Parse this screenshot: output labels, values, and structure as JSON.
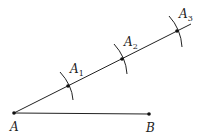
{
  "diagram": {
    "stroke_color": "#222222",
    "points": {
      "A": {
        "label": "A",
        "x": 14,
        "y": 113
      },
      "B": {
        "label": "B",
        "x": 149,
        "y": 114
      },
      "A1": {
        "label": "A",
        "sub": "1",
        "x": 68,
        "y": 86
      },
      "A2": {
        "label": "A",
        "sub": "2",
        "x": 122,
        "y": 59
      },
      "A3": {
        "label": "A",
        "sub": "3",
        "x": 177,
        "y": 31
      }
    },
    "labels": {
      "A": "A",
      "B": "B",
      "A1_main": "A",
      "A1_sub": "1",
      "A2_main": "A",
      "A2_sub": "2",
      "A3_main": "A",
      "A3_sub": "3"
    }
  }
}
